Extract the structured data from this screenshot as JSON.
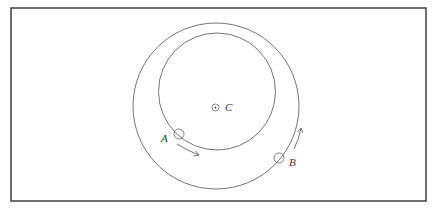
{
  "diagram": {
    "colors": {
      "frame": "#4a4a4a",
      "stroke": "#666666",
      "text": "#333333",
      "background": "#ffffff"
    },
    "frame": {
      "x": 11,
      "y": 8,
      "width": 415,
      "height": 193
    },
    "outer_circle": {
      "cx": 216,
      "cy": 106,
      "r": 83
    },
    "inner_circle": {
      "cx": 217,
      "cy": 91.5,
      "r": 58.5
    },
    "points": [
      {
        "id": "C",
        "label": "C",
        "marker": "dot-in-circle",
        "cx": 215.5,
        "cy": 107.5,
        "r": 3.5,
        "label_x": 225,
        "label_y": 111
      },
      {
        "id": "A",
        "label": "A",
        "marker": "circle",
        "cx": 179,
        "cy": 134,
        "r": 5,
        "label_x": 161,
        "label_y": 142
      },
      {
        "id": "B",
        "label": "B",
        "marker": "circle",
        "cx": 279,
        "cy": 158,
        "r": 5,
        "label_x": 289,
        "label_y": 166
      }
    ],
    "arrows": [
      {
        "id": "arrow-A",
        "direction": "counterclockwise-down-right",
        "path": "M177,144 Q188,151 199,155"
      },
      {
        "id": "arrow-B",
        "direction": "upward-along-outer",
        "path": "M294,149 Q299,139 301,128"
      }
    ]
  }
}
